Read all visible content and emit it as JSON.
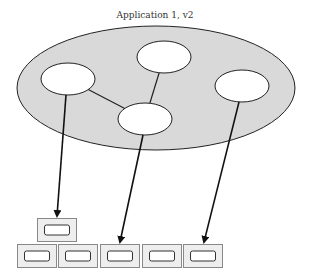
{
  "diagram": {
    "title": "Application 1, v2",
    "colors": {
      "application_fill": "#d9d9d9",
      "node_fill": "#ffffff",
      "stroke": "#222222",
      "box_fill": "#eeeeee",
      "box_stroke": "#888888"
    },
    "application": {
      "cx": 156,
      "cy": 88,
      "rx": 139,
      "ry": 62
    },
    "nodes": [
      {
        "id": "n1",
        "cx": 68,
        "cy": 79,
        "rx": 27,
        "ry": 16
      },
      {
        "id": "n2",
        "cx": 164,
        "cy": 57,
        "rx": 27,
        "ry": 16
      },
      {
        "id": "n3",
        "cx": 145,
        "cy": 119,
        "rx": 27,
        "ry": 16
      },
      {
        "id": "n4",
        "cx": 242,
        "cy": 86,
        "rx": 27,
        "ry": 16
      }
    ],
    "edges": [
      {
        "from": "n1",
        "to": "n3"
      },
      {
        "from": "n2",
        "to": "n3"
      }
    ],
    "containers_top": [
      {
        "x": 37,
        "y": 218,
        "w": 39,
        "h": 23
      }
    ],
    "containers_bottom": [
      {
        "x": 17,
        "y": 244,
        "w": 39,
        "h": 23
      },
      {
        "x": 58,
        "y": 244,
        "w": 39,
        "h": 23
      },
      {
        "x": 100,
        "y": 244,
        "w": 39,
        "h": 23
      },
      {
        "x": 142,
        "y": 244,
        "w": 39,
        "h": 23
      },
      {
        "x": 183,
        "y": 244,
        "w": 39,
        "h": 23
      }
    ],
    "arrows": [
      {
        "x1": 66,
        "y1": 95,
        "x2": 57,
        "y2": 216
      },
      {
        "x1": 143,
        "y1": 135,
        "x2": 120,
        "y2": 242
      },
      {
        "x1": 239,
        "y1": 102,
        "x2": 204,
        "y2": 242
      }
    ]
  }
}
